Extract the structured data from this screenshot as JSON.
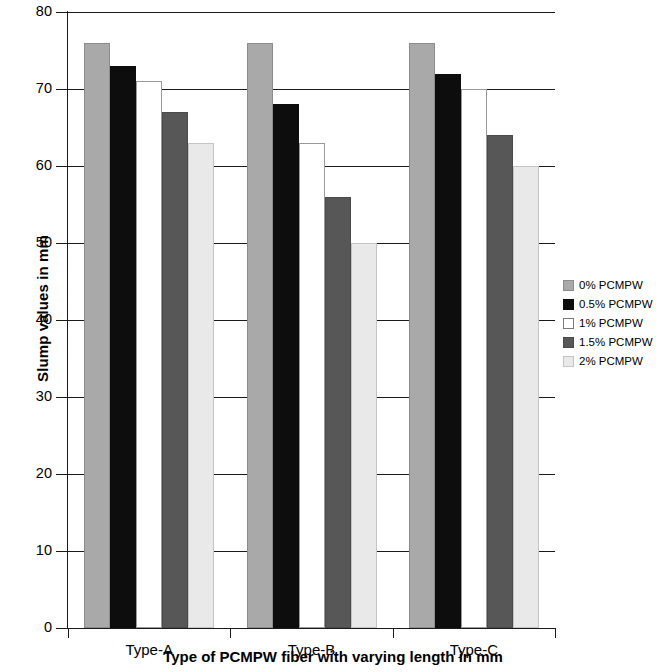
{
  "chart_data": {
    "type": "bar",
    "title": "",
    "xlabel": "Type of PCMPW fiber with varying length in mm",
    "ylabel": "Slump values in mm",
    "categories": [
      "Type-A",
      "Type-B",
      "Type-C"
    ],
    "ylim": [
      0,
      80
    ],
    "y_ticks": [
      0,
      10,
      20,
      30,
      40,
      50,
      60,
      70,
      80
    ],
    "grid": "horizontal",
    "legend_position": "right",
    "series": [
      {
        "name": "0% PCMPW",
        "color": "#a9a9a9",
        "border": "#8c8c8c",
        "values": [
          76,
          76,
          76
        ]
      },
      {
        "name": "0.5% PCMPW",
        "color": "#0d0d0d",
        "border": "#0d0d0d",
        "values": [
          73,
          68,
          72
        ]
      },
      {
        "name": "1% PCMPW",
        "color": "#ffffff",
        "border": "#9a9a9a",
        "values": [
          71,
          63,
          70
        ]
      },
      {
        "name": "1.5% PCMPW",
        "color": "#575757",
        "border": "#4a4a4a",
        "values": [
          67,
          56,
          64
        ]
      },
      {
        "name": "2% PCMPW",
        "color": "#e9e9e9",
        "border": "#c4c4c4",
        "values": [
          63,
          50,
          60
        ]
      }
    ]
  }
}
